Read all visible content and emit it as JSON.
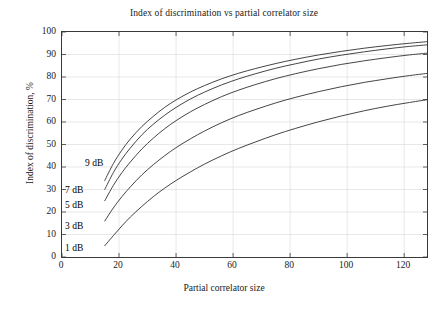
{
  "chart_data": {
    "type": "line",
    "title": "Index of discrimination vs partial correlator size",
    "xlabel": "Partial correlator size",
    "ylabel": "Index of discrimination, %",
    "xlim": [
      0,
      128
    ],
    "ylim": [
      0,
      100
    ],
    "xticks": [
      0,
      20,
      40,
      60,
      80,
      100,
      120
    ],
    "yticks": [
      0,
      10,
      20,
      30,
      40,
      50,
      60,
      70,
      80,
      90,
      100
    ],
    "grid": true,
    "legend_position": "inline-annotations",
    "x": [
      15,
      18,
      21,
      24,
      28,
      32,
      36,
      40,
      45,
      50,
      56,
      62,
      68,
      75,
      82,
      90,
      98,
      106,
      114,
      121,
      128
    ],
    "series": [
      {
        "name": "9 dB",
        "label": "9 dB",
        "color": "#303030",
        "values": [
          34.0,
          41.5,
          47.5,
          52.5,
          58.0,
          62.5,
          66.5,
          69.8,
          73.3,
          76.2,
          79.2,
          81.7,
          83.8,
          86.0,
          87.9,
          89.8,
          91.4,
          92.8,
          94.0,
          94.9,
          95.7
        ]
      },
      {
        "name": "7 dB",
        "label": "7 dB",
        "color": "#303030",
        "values": [
          30.0,
          37.5,
          43.5,
          48.5,
          54.3,
          59.0,
          63.0,
          66.5,
          70.2,
          73.3,
          76.5,
          79.2,
          81.5,
          83.9,
          85.9,
          88.0,
          89.7,
          91.2,
          92.5,
          93.5,
          94.3
        ]
      },
      {
        "name": "5 dB",
        "label": "5 dB",
        "color": "#303030",
        "values": [
          25.0,
          31.8,
          37.5,
          42.3,
          48.0,
          52.8,
          57.0,
          60.6,
          64.5,
          67.8,
          71.3,
          74.2,
          76.7,
          79.3,
          81.5,
          83.7,
          85.6,
          87.2,
          88.6,
          89.7,
          90.6
        ]
      },
      {
        "name": "3 dB",
        "label": "3 dB",
        "color": "#303030",
        "values": [
          16.0,
          21.8,
          26.8,
          31.2,
          36.5,
          41.0,
          45.0,
          48.6,
          52.5,
          56.0,
          59.7,
          62.9,
          65.6,
          68.5,
          71.0,
          73.5,
          75.7,
          77.6,
          79.2,
          80.5,
          81.6
        ]
      },
      {
        "name": "1 dB",
        "label": "1 dB",
        "color": "#303030",
        "values": [
          5.0,
          9.5,
          13.8,
          17.8,
          22.5,
          26.8,
          30.6,
          34.0,
          37.8,
          41.3,
          45.0,
          48.3,
          51.2,
          54.4,
          57.2,
          60.1,
          62.7,
          65.0,
          67.0,
          68.5,
          69.9
        ]
      }
    ],
    "annotations": [
      {
        "text": "9 dB",
        "x_px": 85,
        "y_px": 158
      },
      {
        "text": "7 dB",
        "x_px": 65,
        "y_px": 185
      },
      {
        "text": "5 dB",
        "x_px": 65,
        "y_px": 200
      },
      {
        "text": "3 dB",
        "x_px": 65,
        "y_px": 221
      },
      {
        "text": "1 dB",
        "x_px": 65,
        "y_px": 243
      }
    ],
    "tick_labels": {
      "x": [
        "0",
        "20",
        "40",
        "60",
        "80",
        "100",
        "120"
      ],
      "y": [
        "0",
        "10",
        "20",
        "30",
        "40",
        "50",
        "60",
        "70",
        "80",
        "90",
        "100"
      ]
    }
  }
}
